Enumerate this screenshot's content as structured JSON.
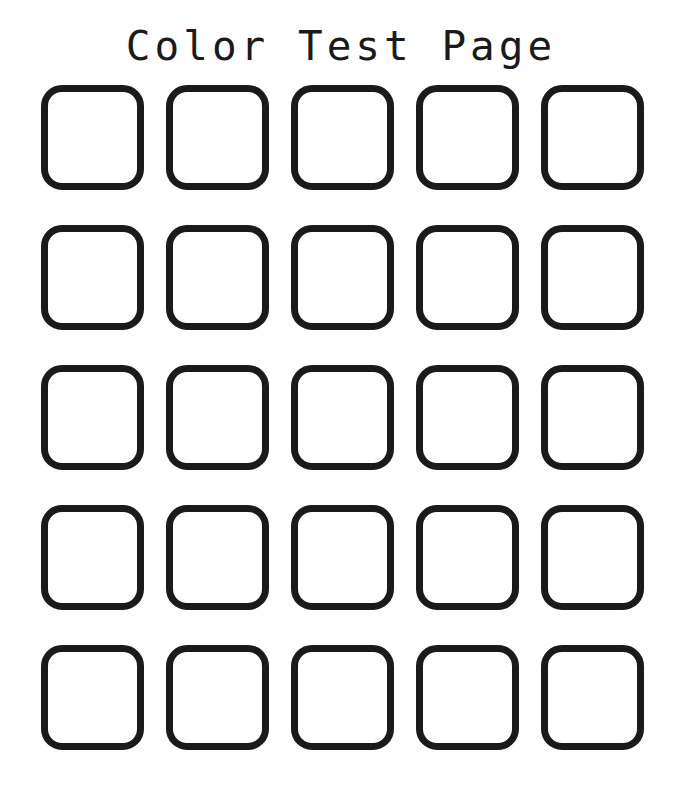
{
  "page": {
    "title": "Color Test Page",
    "background_color": "#ffffff",
    "title_color": "#1a1a1a"
  },
  "grid": {
    "rows": 5,
    "columns": 5,
    "swatch_border_color": "#1a1a1a",
    "swatch_fill_color": "#ffffff",
    "cells": [
      {
        "row": 1,
        "column": 1,
        "fill": "#ffffff",
        "label": ""
      },
      {
        "row": 1,
        "column": 2,
        "fill": "#ffffff",
        "label": ""
      },
      {
        "row": 1,
        "column": 3,
        "fill": "#ffffff",
        "label": ""
      },
      {
        "row": 1,
        "column": 4,
        "fill": "#ffffff",
        "label": ""
      },
      {
        "row": 1,
        "column": 5,
        "fill": "#ffffff",
        "label": ""
      },
      {
        "row": 2,
        "column": 1,
        "fill": "#ffffff",
        "label": ""
      },
      {
        "row": 2,
        "column": 2,
        "fill": "#ffffff",
        "label": ""
      },
      {
        "row": 2,
        "column": 3,
        "fill": "#ffffff",
        "label": ""
      },
      {
        "row": 2,
        "column": 4,
        "fill": "#ffffff",
        "label": ""
      },
      {
        "row": 2,
        "column": 5,
        "fill": "#ffffff",
        "label": ""
      },
      {
        "row": 3,
        "column": 1,
        "fill": "#ffffff",
        "label": ""
      },
      {
        "row": 3,
        "column": 2,
        "fill": "#ffffff",
        "label": ""
      },
      {
        "row": 3,
        "column": 3,
        "fill": "#ffffff",
        "label": ""
      },
      {
        "row": 3,
        "column": 4,
        "fill": "#ffffff",
        "label": ""
      },
      {
        "row": 3,
        "column": 5,
        "fill": "#ffffff",
        "label": ""
      },
      {
        "row": 4,
        "column": 1,
        "fill": "#ffffff",
        "label": ""
      },
      {
        "row": 4,
        "column": 2,
        "fill": "#ffffff",
        "label": ""
      },
      {
        "row": 4,
        "column": 3,
        "fill": "#ffffff",
        "label": ""
      },
      {
        "row": 4,
        "column": 4,
        "fill": "#ffffff",
        "label": ""
      },
      {
        "row": 4,
        "column": 5,
        "fill": "#ffffff",
        "label": ""
      },
      {
        "row": 5,
        "column": 1,
        "fill": "#ffffff",
        "label": ""
      },
      {
        "row": 5,
        "column": 2,
        "fill": "#ffffff",
        "label": ""
      },
      {
        "row": 5,
        "column": 3,
        "fill": "#ffffff",
        "label": ""
      },
      {
        "row": 5,
        "column": 4,
        "fill": "#ffffff",
        "label": ""
      },
      {
        "row": 5,
        "column": 5,
        "fill": "#ffffff",
        "label": ""
      }
    ]
  }
}
